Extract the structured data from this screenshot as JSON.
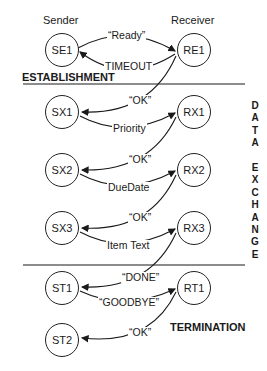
{
  "headers": {
    "sender": "Sender",
    "receiver": "Receiver"
  },
  "sections": {
    "establishment": "ESTABLISHMENT",
    "data_exchange": [
      "D",
      "A",
      "T",
      "A",
      "",
      "E",
      "X",
      "C",
      "H",
      "A",
      "N",
      "G",
      "E"
    ],
    "termination": "TERMINATION"
  },
  "nodes": {
    "SE1": "SE1",
    "RE1": "RE1",
    "SX1": "SX1",
    "RX1": "RX1",
    "SX2": "SX2",
    "RX2": "RX2",
    "SX3": "SX3",
    "RX3": "RX3",
    "ST1": "ST1",
    "RT1": "RT1",
    "ST2": "ST2"
  },
  "edges": {
    "ready": "“Ready”",
    "timeout": "TIMEOUT",
    "ok1": "“OK”",
    "priority": "Priority",
    "ok2": "“OK”",
    "duedate": "DueDate",
    "ok3": "“OK”",
    "itemtext": "Item Text",
    "done": "“DONE”",
    "goodbye": "“GOODBYE”",
    "ok4": "“OK”"
  },
  "colors": {
    "ink": "#1a1a1a",
    "background": "#ffffff"
  }
}
